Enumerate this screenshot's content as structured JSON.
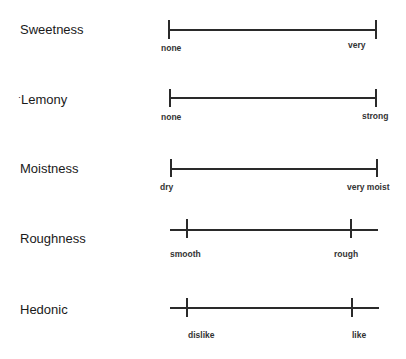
{
  "scales": [
    {
      "attribute": "Sweetness",
      "low_anchor": "none",
      "high_anchor": "very"
    },
    {
      "attribute": "Lemony",
      "low_anchor": "none",
      "high_anchor": "strong"
    },
    {
      "attribute": "Moistness",
      "low_anchor": "dry",
      "high_anchor": "very moist"
    },
    {
      "attribute": "Roughness",
      "low_anchor": "smooth",
      "high_anchor": "rough"
    },
    {
      "attribute": "Hedonic",
      "low_anchor": "dislike",
      "high_anchor": "like"
    }
  ]
}
